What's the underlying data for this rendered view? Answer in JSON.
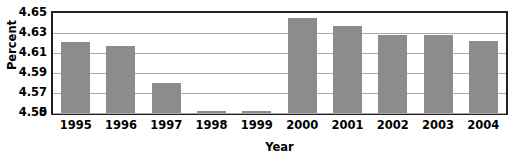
{
  "chart_data": {
    "type": "bar",
    "title": "",
    "xlabel": "Year",
    "ylabel": "Percent",
    "categories": [
      "1995",
      "1996",
      "1997",
      "1998",
      "1999",
      "2000",
      "2001",
      "2002",
      "2003",
      "2004"
    ],
    "values": [
      4.621,
      4.617,
      4.58,
      4.552,
      4.552,
      4.645,
      4.637,
      4.628,
      4.628,
      4.622
    ],
    "ylim": [
      4.55,
      4.65
    ],
    "y_axis_break": true,
    "y_ticks": [
      "0",
      "4.55",
      "4.57",
      "4.59",
      "4.61",
      "4.63",
      "4.65"
    ],
    "y_tick_values": [
      0,
      4.55,
      4.57,
      4.59,
      4.61,
      4.63,
      4.65
    ],
    "grid": true,
    "grid_axis": "y",
    "legend": "none",
    "bar_color": "#8c8c8c",
    "grid_color": "#a7a9ac",
    "frame_color": "#231f20",
    "background_color": "#ffffff"
  },
  "axes": {
    "y_title": "Percent",
    "x_title": "Year"
  }
}
